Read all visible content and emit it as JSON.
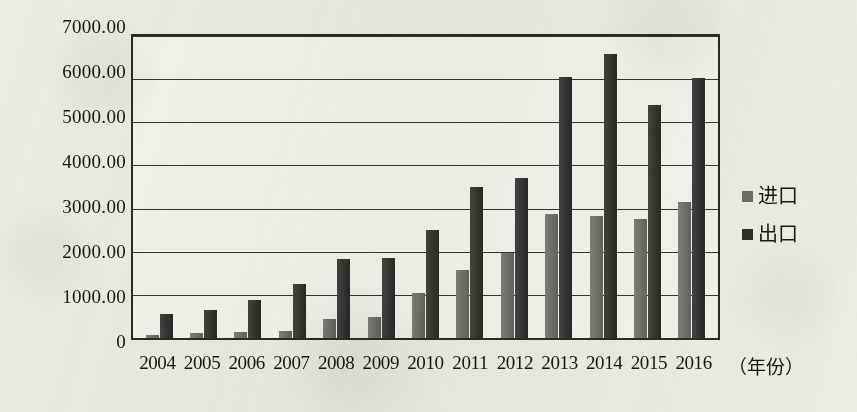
{
  "chart_data": {
    "type": "bar",
    "title": "",
    "subtitle": "",
    "xlabel": "（年份）",
    "ylabel": "",
    "ylim": [
      0,
      7000
    ],
    "grid": true,
    "legend_position": "right",
    "categories": [
      "2004",
      "2005",
      "2006",
      "2007",
      "2008",
      "2009",
      "2010",
      "2011",
      "2012",
      "2013",
      "2014",
      "2015",
      "2016"
    ],
    "y_ticks": [
      0,
      1000,
      2000,
      3000,
      4000,
      5000,
      6000,
      7000
    ],
    "y_tick_labels": [
      "0",
      "1000.00",
      "2000.00",
      "3000.00",
      "4000.00",
      "5000.00",
      "6000.00",
      "7000.00"
    ],
    "series": [
      {
        "name": "进口",
        "color": "#6d6c69",
        "values": [
          60,
          110,
          150,
          160,
          430,
          480,
          1050,
          1570,
          1980,
          2880,
          2830,
          2750,
          3160
        ]
      },
      {
        "name": "出口",
        "color": "#2f2e2c",
        "values": [
          550,
          660,
          880,
          1250,
          1840,
          1860,
          2500,
          3500,
          3700,
          6050,
          6580,
          5400,
          6020
        ]
      }
    ]
  },
  "legend": {
    "items": [
      {
        "label": "进口",
        "swatch": "import-swatch"
      },
      {
        "label": "出口",
        "swatch": "export-swatch"
      }
    ]
  },
  "axis": {
    "x_title": "（年份）"
  }
}
